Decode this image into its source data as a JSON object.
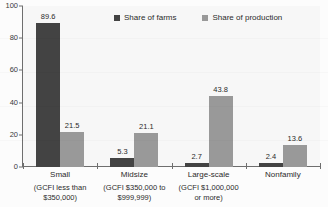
{
  "chart_data": {
    "type": "bar",
    "title": "",
    "subtitle": "",
    "xlabel": "",
    "ylabel": "",
    "ylim": [
      0,
      100
    ],
    "yticks": [
      "0",
      "20",
      "40",
      "60",
      "80",
      "100"
    ],
    "grid": false,
    "legend_position": "top-center",
    "categories": [
      "Small",
      "Midsize",
      "Large-scale",
      "Nonfamily"
    ],
    "category_sublabels": [
      "(GCFI less than\n$350,000)",
      "(GCFI $350,000 to\n$999,999)",
      "(GCFI $1,000,000\nor more)",
      ""
    ],
    "series": [
      {
        "name": "Share of farms",
        "color": "#434343",
        "values": [
          89.6,
          5.3,
          2.7,
          2.4
        ],
        "labels": [
          "89.6",
          "5.3",
          "2.7",
          "2.4"
        ]
      },
      {
        "name": "Share of production",
        "color": "#999999",
        "values": [
          21.5,
          21.1,
          43.8,
          13.6
        ],
        "labels": [
          "21.5",
          "21.1",
          "43.8",
          "13.6"
        ]
      }
    ]
  },
  "legend": {
    "items": [
      {
        "label": "Share of farms",
        "color": "#434343"
      },
      {
        "label": "Share of production",
        "color": "#999999"
      }
    ]
  },
  "colors": {
    "series_farms": "#434343",
    "series_production": "#999999",
    "axis": "#6e6e6e",
    "text": "#2b2b2b",
    "plot_background": "#f7f7f7"
  }
}
